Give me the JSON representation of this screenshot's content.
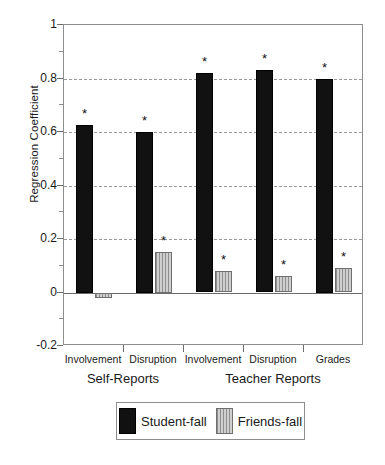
{
  "chart_data": {
    "type": "bar",
    "title": "",
    "xlabel": "",
    "ylabel": "Regression Coefficient",
    "ylim": [
      -0.2,
      1.0
    ],
    "yticks": [
      1,
      0.8,
      0.6,
      0.4,
      0.2,
      0,
      -0.2
    ],
    "ytick_labels": [
      "1",
      "0.8",
      "0.6",
      "0.4",
      "0.2",
      "0",
      "-0.2"
    ],
    "grid": "horizontal-dashed",
    "legend_position": "bottom-center",
    "categories": [
      "Involvement",
      "Disruption",
      "Involvement",
      "Disruption",
      "Grades"
    ],
    "category_groups": [
      {
        "label": "Self-Reports",
        "categories": [
          "Involvement",
          "Disruption"
        ]
      },
      {
        "label": "Teacher Reports",
        "categories": [
          "Involvement",
          "Disruption",
          "Grades"
        ]
      }
    ],
    "series": [
      {
        "name": "Student-fall",
        "color": "#111111",
        "pattern": "solid",
        "values": [
          0.625,
          0.6,
          0.82,
          0.83,
          0.8
        ],
        "significance": [
          "*",
          "*",
          "*",
          "*",
          "*"
        ]
      },
      {
        "name": "Friends-fall",
        "color": "#b6b6b6",
        "pattern": "vertical-stripes",
        "values": [
          -0.02,
          0.15,
          0.08,
          0.06,
          0.09
        ],
        "significance": [
          "",
          "*",
          "*",
          "*",
          "*"
        ]
      }
    ],
    "annotations": [
      {
        "text": "*",
        "meaning": "statistically significant"
      }
    ]
  }
}
